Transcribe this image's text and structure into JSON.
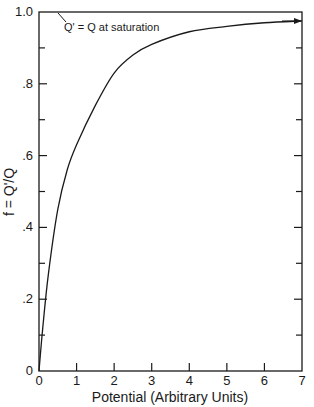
{
  "chart_data": {
    "type": "line",
    "title": "",
    "xlabel": "Potential (Arbitrary Units)",
    "ylabel": "f = Q'/Q",
    "xlim": [
      0,
      7
    ],
    "ylim": [
      0,
      1.0
    ],
    "x_ticks": [
      0,
      1,
      2,
      3,
      4,
      5,
      6,
      7
    ],
    "x_tick_labels": [
      "0",
      "1",
      "2",
      "3",
      "4",
      "5",
      "6",
      "7"
    ],
    "y_ticks_major": [
      0,
      0.2,
      0.4,
      0.6,
      0.8,
      1.0
    ],
    "y_tick_labels": [
      "0",
      ".2",
      ".4",
      ".6",
      ".8",
      "1.0"
    ],
    "y_ticks_minor": [
      0.1,
      0.3,
      0.5,
      0.7,
      0.9
    ],
    "grid": false,
    "legend": null,
    "series": [
      {
        "name": "f",
        "x": [
          0,
          0.1,
          0.25,
          0.5,
          0.75,
          1.0,
          1.5,
          2.0,
          2.5,
          3.0,
          4.0,
          5.0,
          6.0,
          7.0
        ],
        "values": [
          0,
          0.12,
          0.27,
          0.45,
          0.56,
          0.63,
          0.74,
          0.83,
          0.88,
          0.91,
          0.945,
          0.96,
          0.97,
          0.975
        ]
      }
    ],
    "annotations": [
      {
        "text": "Q' = Q at saturation",
        "points_to": [
          0,
          1.0
        ]
      }
    ]
  },
  "labels": {
    "xlabel": "Potential (Arbitrary Units)",
    "ylabel": "f = Q'/Q",
    "annotation": "Q' = Q at saturation"
  }
}
